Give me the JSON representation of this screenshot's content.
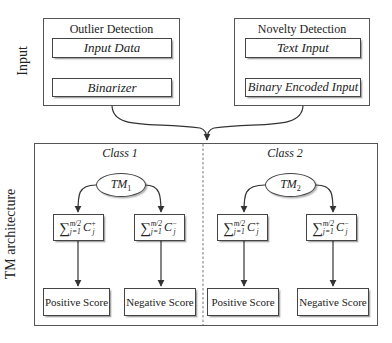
{
  "side_labels": {
    "input": "Input",
    "architecture": "TM architecture"
  },
  "input_panels": [
    {
      "title": "Outlier Detection",
      "steps": [
        "Input Data",
        "Binarizer"
      ]
    },
    {
      "title": "Novelty Detection",
      "steps": [
        "Text Input",
        "Binary Encoded Input"
      ]
    }
  ],
  "classes": [
    {
      "label": "Class 1",
      "machine": {
        "base": "TM",
        "sub": "1"
      },
      "clauses": [
        {
          "sum_upper": "m/2",
          "sum_lower": "j=1",
          "var": "C",
          "sup": "+",
          "sub": "j"
        },
        {
          "sum_upper": "m/2",
          "sum_lower": "j=1",
          "var": "C",
          "sup": "−",
          "sub": "j"
        }
      ],
      "scores": [
        "Positive Score",
        "Negative Score"
      ]
    },
    {
      "label": "Class 2",
      "machine": {
        "base": "TM",
        "sub": "2"
      },
      "clauses": [
        {
          "sum_upper": "m/2",
          "sum_lower": "j=1",
          "var": "C",
          "sup": "+",
          "sub": "j"
        },
        {
          "sum_upper": "m/2",
          "sum_lower": "j=1",
          "var": "C",
          "sup": "−",
          "sub": "j"
        }
      ],
      "scores": [
        "Positive Score",
        "Negative Score"
      ]
    }
  ],
  "symbols": {
    "sum": "∑"
  },
  "colors": {
    "line": "#444444",
    "frame": "#555555",
    "background": "#ffffff"
  }
}
